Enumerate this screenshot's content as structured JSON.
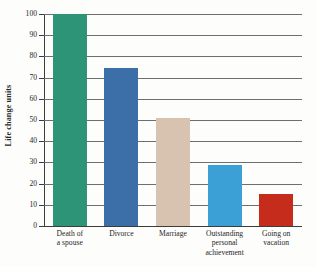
{
  "chart_data": {
    "type": "bar",
    "title": "",
    "subtitle": "",
    "xlabel": "",
    "ylabel": "Life change units",
    "ylim": [
      0,
      100
    ],
    "ytick_labels": [
      "100",
      "90",
      "80",
      "70",
      "60",
      "50",
      "40",
      "30",
      "20",
      "10",
      "0"
    ],
    "ytick_values": [
      100,
      90,
      80,
      70,
      60,
      50,
      40,
      30,
      20,
      10,
      0
    ],
    "grid": true,
    "legend": "none",
    "categories": [
      "Death of a spouse",
      "Divorce",
      "Marriage",
      "Outstanding personal achievement",
      "Going on vacation"
    ],
    "category_lines": [
      [
        "Death of",
        "a spouse"
      ],
      [
        "Divorce"
      ],
      [
        "Marriage"
      ],
      [
        "Outstanding",
        "personal",
        "achievement"
      ],
      [
        "Going on",
        "vacation"
      ]
    ],
    "values": [
      100,
      74.5,
      51,
      29,
      15
    ],
    "colors": [
      "#2e9477",
      "#3c6ea8",
      "#d8c3b0",
      "#3ba0d6",
      "#c52c1c"
    ]
  },
  "axis": {
    "y_title": "Life change units"
  }
}
